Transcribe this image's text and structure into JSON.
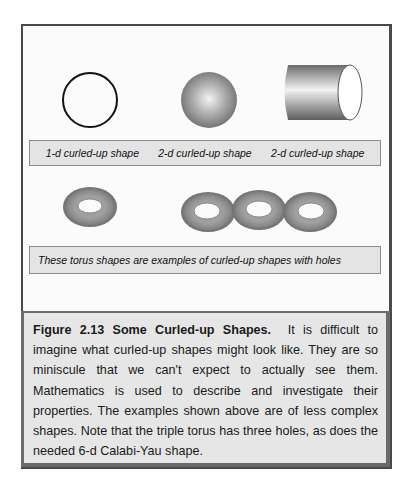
{
  "figure": {
    "shape_labels": [
      "1-d curled-up shape",
      "2-d curled-up shape",
      "2-d curled-up shape"
    ],
    "torus_label": "These torus shapes are examples of curled-up shapes with holes",
    "shapes": [
      {
        "name": "circle",
        "description": "1-d curled-up shape (outline circle)"
      },
      {
        "name": "sphere",
        "description": "2-d curled-up shape (shaded sphere)"
      },
      {
        "name": "cylinder",
        "description": "2-d curled-up shape (shaded cylinder)"
      },
      {
        "name": "single-torus",
        "holes": 1
      },
      {
        "name": "triple-torus",
        "holes": 3
      }
    ],
    "colors": {
      "frame_border": "#4a4a4a",
      "label_bar_bg": "#e4e4e4",
      "caption_bg": "#e6e6e6",
      "torus_fill": "#8c8c8c"
    }
  },
  "caption": {
    "title": "Figure 2.13 Some Curled-up Shapes.",
    "body": "It is difficult to imagine what curled-up shapes might look like.  They are so miniscule that we can't expect to actually see them.  Mathematics is used to describe and investigate their properties.  The examples shown above are of less complex shapes.  Note that the triple torus has three holes, as does the needed 6-d Calabi-Yau shape."
  }
}
